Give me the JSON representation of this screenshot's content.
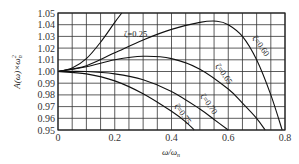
{
  "chart_data": {
    "type": "line",
    "title": "",
    "xlabel": "ω/ωn",
    "ylabel": "A(ω)×ωn²",
    "xlim": [
      0,
      0.8
    ],
    "ylim": [
      0.95,
      1.05
    ],
    "grid": true,
    "x_ticks": [
      "0",
      "0.2",
      "0.4",
      "0.6",
      "0.8"
    ],
    "y_ticks": [
      "1.05",
      "1.04",
      "1.03",
      "1.02",
      "1.01",
      "1.00",
      "0.99",
      "0.98",
      "0.97",
      "0.96",
      "0.95"
    ],
    "series": [
      {
        "name": "ζ=0.25",
        "label": "ζ=0.25",
        "x": [
          0,
          0.05,
          0.1,
          0.15,
          0.2,
          0.225
        ],
        "y": [
          1.0,
          1.003,
          1.011,
          1.025,
          1.042,
          1.05
        ]
      },
      {
        "name": "ζ=0.60",
        "label": "ζ=0.60",
        "x": [
          0,
          0.1,
          0.2,
          0.3,
          0.4,
          0.5,
          0.56,
          0.6,
          0.65,
          0.7,
          0.75,
          0.79
        ],
        "y": [
          1.0,
          1.005,
          1.016,
          1.027,
          1.036,
          1.042,
          1.043,
          1.04,
          1.03,
          1.01,
          0.98,
          0.95
        ]
      },
      {
        "name": "ζ=0.65",
        "label": "ζ=0.65",
        "x": [
          0,
          0.1,
          0.2,
          0.3,
          0.4,
          0.5,
          0.6,
          0.65,
          0.7,
          0.73
        ],
        "y": [
          1.0,
          1.004,
          1.01,
          1.013,
          1.011,
          1.002,
          0.985,
          0.973,
          0.96,
          0.95
        ]
      },
      {
        "name": "ζ=0.70",
        "label": "ζ=0.70",
        "x": [
          0,
          0.1,
          0.2,
          0.3,
          0.4,
          0.5,
          0.55,
          0.6
        ],
        "y": [
          1.0,
          1.0,
          0.998,
          0.993,
          0.983,
          0.968,
          0.959,
          0.95
        ]
      },
      {
        "name": "ζ=0.75",
        "label": "ζ=0.75",
        "x": [
          0,
          0.1,
          0.2,
          0.3,
          0.4,
          0.45,
          0.48
        ],
        "y": [
          1.0,
          0.998,
          0.992,
          0.981,
          0.966,
          0.957,
          0.95
        ]
      }
    ]
  },
  "axes": {
    "x_label": "ω/ω",
    "x_label_sub": "n",
    "y_label": "A(ω)×ω",
    "y_label_sup": "2",
    "y_label_sub": "n"
  }
}
